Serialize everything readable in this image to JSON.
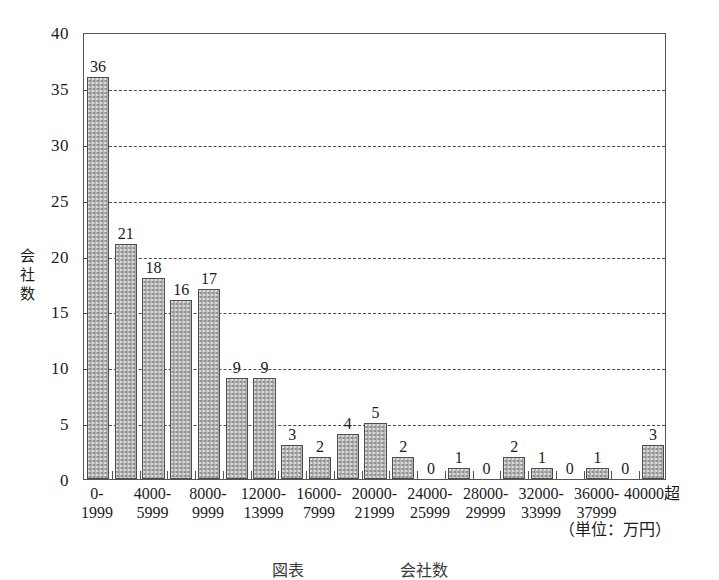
{
  "chart_data": {
    "type": "bar",
    "title": "",
    "xlabel": "",
    "ylabel": "会社数",
    "unit_note": "（単位：万円）",
    "ylim": [
      0,
      40
    ],
    "y_ticks": [
      0,
      5,
      10,
      15,
      20,
      25,
      30,
      35,
      40
    ],
    "grid": "horizontal dashed lines at 5,10,15,20,25,30,35",
    "legend": "none",
    "categories": [
      "0-1999",
      "2000-3999",
      "4000-5999",
      "6000-7999",
      "8000-9999",
      "10000-11999",
      "12000-13999",
      "14000-15999",
      "16000-7999",
      "18000-19999",
      "20000-21999",
      "22000-23999",
      "24000-25999",
      "26000-27999",
      "28000-29999",
      "30000-31999",
      "32000-33999",
      "34000-35999",
      "36000-37999",
      "38000-39999",
      "40000超"
    ],
    "visible_tick_labels": [
      {
        "index": 0,
        "line1": "0-",
        "line2": "1999"
      },
      {
        "index": 2,
        "line1": "4000-",
        "line2": "5999"
      },
      {
        "index": 4,
        "line1": "8000-",
        "line2": "9999"
      },
      {
        "index": 6,
        "line1": "12000-",
        "line2": "13999"
      },
      {
        "index": 8,
        "line1": "16000-",
        "line2": "7999"
      },
      {
        "index": 10,
        "line1": "20000-",
        "line2": "21999"
      },
      {
        "index": 12,
        "line1": "24000-",
        "line2": "25999"
      },
      {
        "index": 14,
        "line1": "28000-",
        "line2": "29999"
      },
      {
        "index": 16,
        "line1": "32000-",
        "line2": "33999"
      },
      {
        "index": 18,
        "line1": "36000-",
        "line2": "37999"
      },
      {
        "index": 20,
        "line1": "40000超",
        "line2": ""
      }
    ],
    "values": [
      36,
      21,
      18,
      16,
      17,
      9,
      9,
      3,
      2,
      4,
      5,
      2,
      0,
      1,
      0,
      2,
      1,
      0,
      1,
      0,
      3
    ],
    "bar_fill_color": "#b2b2b2",
    "bar_border_color": "#4d4d4d",
    "axis_color": "#555555",
    "grid_color": "#4a4a4a",
    "background_color": "#ffffff"
  },
  "caption": "図表　　　　　　会社数"
}
